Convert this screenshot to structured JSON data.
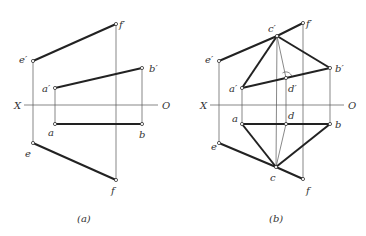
{
  "figures": [
    {
      "id": "a",
      "caption": "(a)",
      "axis": {
        "left_label": "X",
        "right_label": "O"
      },
      "points": {
        "e_prime": {
          "label": "e′",
          "x": 33,
          "y": 61
        },
        "f_prime": {
          "label": "f′",
          "x": 116,
          "y": 24
        },
        "a_prime": {
          "label": "a′",
          "x": 55,
          "y": 88
        },
        "b_prime": {
          "label": "b′",
          "x": 142,
          "y": 68
        },
        "a": {
          "label": "a",
          "x": 55,
          "y": 124
        },
        "b": {
          "label": "b",
          "x": 142,
          "y": 124
        },
        "e": {
          "label": "e",
          "x": 33,
          "y": 143
        },
        "f": {
          "label": "f",
          "x": 116,
          "y": 180
        }
      }
    },
    {
      "id": "b",
      "caption": "(b)",
      "axis": {
        "left_label": "X",
        "right_label": "O"
      },
      "points": {
        "e_prime": {
          "label": "e′",
          "x": 219,
          "y": 61
        },
        "f_prime": {
          "label": "f′",
          "x": 303,
          "y": 23
        },
        "c_prime": {
          "label": "c′",
          "x": 277,
          "y": 36
        },
        "a_prime": {
          "label": "a′",
          "x": 242,
          "y": 88
        },
        "b_prime": {
          "label": "b′",
          "x": 330,
          "y": 68
        },
        "d_prime": {
          "label": "d′",
          "x": 286,
          "y": 78
        },
        "a": {
          "label": "a",
          "x": 242,
          "y": 124
        },
        "d": {
          "label": "d",
          "x": 286,
          "y": 124
        },
        "b": {
          "label": "b",
          "x": 330,
          "y": 124
        },
        "e": {
          "label": "e",
          "x": 219,
          "y": 143
        },
        "c": {
          "label": "c",
          "x": 276,
          "y": 167
        },
        "f": {
          "label": "f",
          "x": 303,
          "y": 179
        }
      }
    }
  ]
}
